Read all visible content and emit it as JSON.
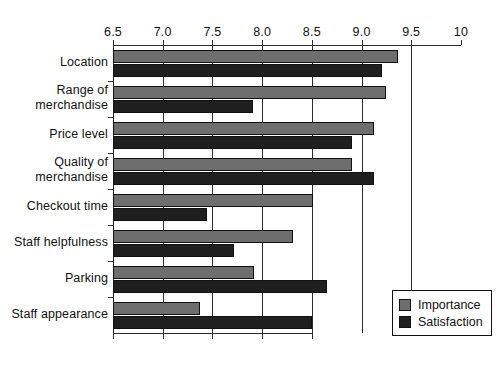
{
  "chart_data": {
    "type": "bar",
    "orientation": "horizontal",
    "title": "",
    "xlabel": "",
    "ylabel": "",
    "xlim": [
      6.5,
      10
    ],
    "grid": true,
    "legend_position": "bottom-right",
    "categories": [
      "Location",
      "Range of\nmerchandise",
      "Price level",
      "Quality of\nmerchandise",
      "Checkout time",
      "Staff helpfulness",
      "Parking",
      "Staff appearance"
    ],
    "tick_labels": [
      "6.5",
      "7.0",
      "7.5",
      "8.0",
      "8.5",
      "9.0",
      "9.5",
      "10"
    ],
    "tick_values": [
      6.5,
      7.0,
      7.5,
      8.0,
      8.5,
      9.0,
      9.5,
      10
    ],
    "series": [
      {
        "name": "Importance",
        "color": "#6e6e6e",
        "values": [
          9.37,
          9.25,
          9.13,
          8.9,
          8.51,
          8.31,
          7.92,
          7.38
        ]
      },
      {
        "name": "Satisfaction",
        "color": "#1f1f1f",
        "values": [
          9.21,
          7.91,
          8.9,
          9.13,
          7.45,
          7.72,
          8.65,
          8.5
        ]
      }
    ]
  },
  "legend": {
    "items": [
      {
        "label": "Importance",
        "swatch": "importance"
      },
      {
        "label": "Satisfaction",
        "swatch": "satisfaction"
      }
    ]
  }
}
